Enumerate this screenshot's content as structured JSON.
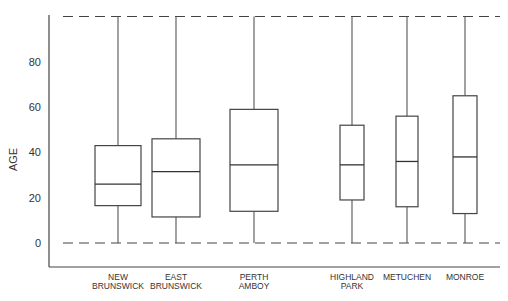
{
  "chart_data": {
    "type": "box",
    "title": "",
    "xlabel": "",
    "ylabel": "AGE",
    "ylim": [
      -10,
      100
    ],
    "yticks": [
      0,
      20,
      40,
      60,
      80
    ],
    "reference_lines": [
      0,
      100
    ],
    "grid": false,
    "categories": [
      {
        "label_lines": [
          "NEW",
          "BRUNSWICK"
        ]
      },
      {
        "label_lines": [
          "EAST",
          "BRUNSWICK"
        ]
      },
      {
        "label_lines": [
          "PERTH",
          "AMBOY"
        ]
      },
      {
        "label_lines": [
          "HIGHLAND",
          "PARK"
        ]
      },
      {
        "label_lines": [
          "METUCHEN"
        ]
      },
      {
        "label_lines": [
          "MONROE"
        ]
      }
    ],
    "series": [
      {
        "name": "NEW BRUNSWICK",
        "min": 0,
        "q1": 16.5,
        "median": 26,
        "q3": 43,
        "max": 100
      },
      {
        "name": "EAST BRUNSWICK",
        "min": 0,
        "q1": 11.5,
        "median": 31.5,
        "q3": 46,
        "max": 100
      },
      {
        "name": "PERTH AMBOY",
        "min": 0,
        "q1": 14,
        "median": 34.5,
        "q3": 59,
        "max": 100
      },
      {
        "name": "HIGHLAND PARK",
        "min": 0,
        "q1": 19,
        "median": 34.5,
        "q3": 52,
        "max": 100
      },
      {
        "name": "METUCHEN",
        "min": 0,
        "q1": 16,
        "median": 36,
        "q3": 56,
        "max": 100
      },
      {
        "name": "MONROE",
        "min": 0,
        "q1": 13,
        "median": 38,
        "q3": 65,
        "max": 100
      }
    ]
  }
}
